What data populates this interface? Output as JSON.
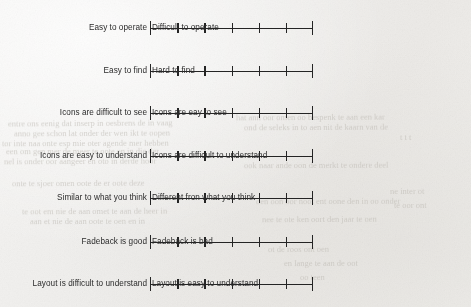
{
  "document": {
    "type": "semantic-differential-questionnaire",
    "background_color": "#f2f1ef",
    "ink_color": "#242424",
    "text_color": "#2b2b2b"
  },
  "scale": {
    "points": 7,
    "intervals": 6,
    "end_marker": "tall-bar",
    "interior_marker": "short-tick",
    "left_px": 150,
    "right_px": 313,
    "selected_value": null
  },
  "items": [
    {
      "index": 1,
      "left_label": "Easy to operate",
      "right_label": "Difficult to operate",
      "top_px": 20
    },
    {
      "index": 2,
      "left_label": "Easy to find",
      "right_label": "Hard to find",
      "top_px": 63
    },
    {
      "index": 3,
      "left_label": "Icons are difficult to see",
      "right_label": "Icons are eay to see",
      "top_px": 105
    },
    {
      "index": 4,
      "left_label": "Icons are easy to understand",
      "right_label": "Icons are difficult to understand",
      "top_px": 148
    },
    {
      "index": 5,
      "left_label": "Similar to what you think",
      "right_label": "Different fron what you think",
      "top_px": 190
    },
    {
      "index": 6,
      "left_label": "Fadeback is good",
      "right_label": "Fadeback is bad",
      "top_px": 234
    },
    {
      "index": 7,
      "left_label": "Layout is difficult to understand",
      "right_label": "Layout is easy to understand",
      "top_px": 276
    }
  ],
  "showthrough": [
    {
      "text": "entre ons eenig dat inserp in oesbrens de in vaag",
      "x": 8,
      "y": 118,
      "size": 8.5,
      "rot": -0.4
    },
    {
      "text": "anno gee schon lat onder der wen ikt te oopen",
      "x": 14,
      "y": 128,
      "size": 8.5,
      "rot": -0.3
    },
    {
      "text": "tor inte naa onte esp mie oter agende mer hebben",
      "x": 2,
      "y": 138,
      "size": 8.5,
      "rot": -0.2
    },
    {
      "text": "hat ann oor omen oo bespenk te aan een kar",
      "x": 236,
      "y": 112,
      "size": 8.5,
      "rot": -0.3
    },
    {
      "text": "ond de seleks in to aen nit de kaarn van de",
      "x": 244,
      "y": 122,
      "size": 8.5,
      "rot": -0.3
    },
    {
      "text": "een om gen mer de meer te oote en in die der",
      "x": 6,
      "y": 146,
      "size": 8.5,
      "rot": -0.2
    },
    {
      "text": "nel is onder oor aangeer en oto in derde hoor",
      "x": 4,
      "y": 156,
      "size": 8.5,
      "rot": -0.3
    },
    {
      "text": "ook naar ande oon de merkt te ondere deel",
      "x": 244,
      "y": 160,
      "size": 8.5,
      "rot": -0.2
    },
    {
      "text": "onte te sjoer omen oote de er oote deze",
      "x": 12,
      "y": 178,
      "size": 8.5,
      "rot": -0.3
    },
    {
      "text": "te oot em nie de aan omet te aan de heer in",
      "x": 22,
      "y": 206,
      "size": 8.5,
      "rot": -0.3
    },
    {
      "text": "oen oon oor noot ent oone den in oo onder",
      "x": 256,
      "y": 196,
      "size": 8.5,
      "rot": -0.2
    },
    {
      "text": "nee te ote ken oort den jaar te oen",
      "x": 262,
      "y": 214,
      "size": 8.5,
      "rot": -0.3
    },
    {
      "text": "aan et nie de aan oote te oen en in",
      "x": 30,
      "y": 216,
      "size": 8.5,
      "rot": -0.2
    },
    {
      "text": "ot de roos ont oen",
      "x": 268,
      "y": 244,
      "size": 8.5,
      "rot": -0.3
    },
    {
      "text": "en lange te aan de oot",
      "x": 284,
      "y": 258,
      "size": 8.5,
      "rot": -0.2
    },
    {
      "text": "oo teen",
      "x": 300,
      "y": 272,
      "size": 8.5,
      "rot": -0.3
    },
    {
      "text": "ne inter ot",
      "x": 390,
      "y": 186,
      "size": 8.5,
      "rot": -0.3
    },
    {
      "text": "te oor ont",
      "x": 394,
      "y": 200,
      "size": 8.5,
      "rot": -0.2
    },
    {
      "text": "t t t",
      "x": 400,
      "y": 132,
      "size": 8.5,
      "rot": 0
    }
  ]
}
